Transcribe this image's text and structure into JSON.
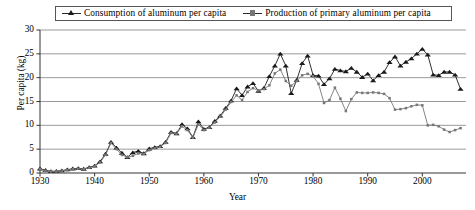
{
  "legend": {
    "position": "top",
    "entries": [
      {
        "label": "Consumption of aluminum per capita",
        "marker": "triangle-marker-icon",
        "color": "#1a1a1a"
      },
      {
        "label": "Production of primary aluminum per capita",
        "marker": "square-marker-icon",
        "color": "#777777"
      }
    ]
  },
  "axes": {
    "ylabel": "Per capita (kg)",
    "xlabel": "Year",
    "yticks": [
      "0",
      "5",
      "10",
      "15",
      "20",
      "25",
      "30"
    ],
    "xticks": [
      "1930",
      "1940",
      "1950",
      "1960",
      "1970",
      "1980",
      "1990",
      "2000"
    ]
  },
  "chart_data": {
    "type": "line",
    "title": "",
    "xlabel": "Year",
    "ylabel": "Per capita (kg)",
    "xlim": [
      1930,
      2008
    ],
    "ylim": [
      0,
      30
    ],
    "yticks": [
      0,
      5,
      10,
      15,
      20,
      25,
      30
    ],
    "xticks": [
      1930,
      1940,
      1950,
      1960,
      1970,
      1980,
      1990,
      2000
    ],
    "grid": "horizontal",
    "legend_position": "top",
    "x": [
      1930,
      1931,
      1932,
      1933,
      1934,
      1935,
      1936,
      1937,
      1938,
      1939,
      1940,
      1941,
      1942,
      1943,
      1944,
      1945,
      1946,
      1947,
      1948,
      1949,
      1950,
      1951,
      1952,
      1953,
      1954,
      1955,
      1956,
      1957,
      1958,
      1959,
      1960,
      1961,
      1962,
      1963,
      1964,
      1965,
      1966,
      1967,
      1968,
      1969,
      1970,
      1971,
      1972,
      1973,
      1974,
      1975,
      1976,
      1977,
      1978,
      1979,
      1980,
      1981,
      1982,
      1983,
      1984,
      1985,
      1986,
      1987,
      1988,
      1989,
      1990,
      1991,
      1992,
      1993,
      1994,
      1995,
      1996,
      1997,
      1998,
      1999,
      2000,
      2001,
      2002,
      2003,
      2004,
      2005,
      2006,
      2007
    ],
    "series": [
      {
        "name": "Consumption of aluminum per capita",
        "marker": "triangle",
        "color": "#1a1a1a",
        "values": [
          0.9,
          0.6,
          0.35,
          0.4,
          0.5,
          0.7,
          0.9,
          1.0,
          0.85,
          1.2,
          1.5,
          2.4,
          4.0,
          6.5,
          5.3,
          4.2,
          3.3,
          4.3,
          4.6,
          4.1,
          5.1,
          5.4,
          5.6,
          6.5,
          8.6,
          8.3,
          10.2,
          9.3,
          7.5,
          10.8,
          9.2,
          9.6,
          10.9,
          12.0,
          13.6,
          15.2,
          17.7,
          16.3,
          18.1,
          18.8,
          17.2,
          17.8,
          20.3,
          22.5,
          25.0,
          22.5,
          16.7,
          19.5,
          23.0,
          24.6,
          20.5,
          20.4,
          18.6,
          19.8,
          21.8,
          21.5,
          21.3,
          22.0,
          21.2,
          20.1,
          20.8,
          19.4,
          20.5,
          21.2,
          23.2,
          24.4,
          22.5,
          23.3,
          24.0,
          25.0,
          26.0,
          24.8,
          20.6,
          20.5,
          21.2,
          21.2,
          20.6,
          17.6
        ]
      },
      {
        "name": "Production of primary aluminum per capita",
        "marker": "square",
        "color": "#777777",
        "values": [
          0.8,
          0.5,
          0.3,
          0.35,
          0.45,
          0.6,
          0.8,
          0.9,
          0.8,
          1.1,
          1.4,
          2.2,
          3.8,
          6.3,
          5.0,
          3.8,
          3.3,
          3.6,
          4.1,
          4.0,
          4.8,
          5.2,
          5.5,
          6.3,
          8.4,
          8.2,
          9.8,
          9.0,
          7.4,
          10.2,
          9.0,
          9.5,
          10.6,
          11.8,
          13.3,
          14.9,
          16.3,
          15.3,
          17.0,
          17.8,
          17.3,
          17.6,
          18.4,
          20.9,
          21.7,
          19.3,
          18.3,
          19.3,
          20.5,
          20.8,
          20.3,
          18.7,
          14.7,
          15.3,
          17.9,
          15.6,
          13.0,
          15.5,
          16.9,
          16.8,
          16.8,
          16.9,
          16.8,
          16.6,
          15.7,
          13.3,
          13.4,
          13.6,
          14.0,
          14.3,
          14.2,
          10.0,
          10.1,
          9.8,
          9.1,
          8.6,
          9.0,
          9.4
        ]
      }
    ]
  }
}
